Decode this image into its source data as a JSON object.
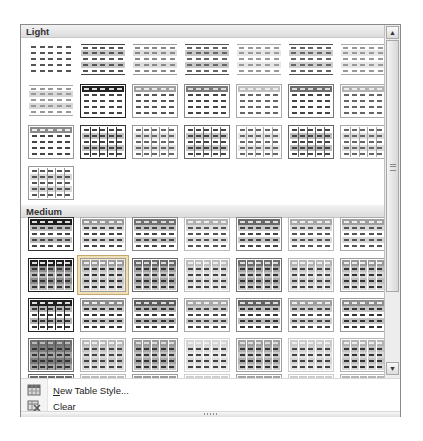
{
  "gallery": {
    "sections": [
      {
        "id": "light",
        "label": "Light",
        "top": 0
      },
      {
        "id": "medium",
        "label": "Medium",
        "top": 180
      }
    ],
    "columns_x": [
      7,
      59,
      111,
      163,
      215,
      267,
      319
    ],
    "light_rows_y": [
      18,
      59,
      100,
      141
    ],
    "medium_rows_y": [
      192,
      233,
      273,
      313,
      349
    ],
    "selected": {
      "section": "medium",
      "row": 1,
      "col": 1
    },
    "light_styles": [
      [
        {
          "header": "#ffffff",
          "band": "#ffffff",
          "lines": "none",
          "dash": "#555"
        },
        {
          "header": "#ffffff",
          "band": "#c8c8c8",
          "lines": "hrule",
          "rule": "#444",
          "dash": "#555"
        },
        {
          "header": "#ffffff",
          "band": "#dedede",
          "lines": "hrule",
          "rule": "#999",
          "dash": "#888"
        },
        {
          "header": "#ffffff",
          "band": "#c8c8c8",
          "lines": "hrule",
          "rule": "#555",
          "dash": "#666"
        },
        {
          "header": "#ffffff",
          "band": "#e6e6e6",
          "lines": "hrule",
          "rule": "#aaa",
          "dash": "#999"
        },
        {
          "header": "#ffffff",
          "band": "#cfcfcf",
          "lines": "hrule",
          "rule": "#555",
          "dash": "#666"
        },
        {
          "header": "#ffffff",
          "band": "#e6e6e6",
          "lines": "hrule",
          "rule": "#aaa",
          "dash": "#999"
        }
      ],
      [
        {
          "header": "#ffffff",
          "band": "#d8d8d8",
          "lines": "hrule",
          "rule": "#aaa",
          "dash": "#999"
        },
        {
          "header": "#222222",
          "band": "#ffffff",
          "lines": "rows",
          "rule": "#222",
          "dash": "#444",
          "hdash": "#ddd"
        },
        {
          "header": "#a0a0a0",
          "band": "#ffffff",
          "lines": "rows",
          "rule": "#999",
          "dash": "#555",
          "hdash": "#eee"
        },
        {
          "header": "#7a7a7a",
          "band": "#ffffff",
          "lines": "rows",
          "rule": "#888",
          "dash": "#444",
          "hdash": "#ddd"
        },
        {
          "header": "#c0c0c0",
          "band": "#ffffff",
          "lines": "rows",
          "rule": "#aaa",
          "dash": "#666",
          "hdash": "#eee"
        },
        {
          "header": "#6e6e6e",
          "band": "#ffffff",
          "lines": "rows",
          "rule": "#777",
          "dash": "#444",
          "hdash": "#ddd"
        },
        {
          "header": "#b4b4b4",
          "band": "#ffffff",
          "lines": "rows",
          "rule": "#aaa",
          "dash": "#666",
          "hdash": "#eee"
        }
      ],
      [
        {
          "header": "#8a8a8a",
          "band": "#ffffff",
          "lines": "rows",
          "rule": "#999",
          "dash": "#444",
          "hdash": "#eee"
        },
        {
          "header": "#ffffff",
          "band": "#c4c4c4",
          "lines": "grid",
          "rule": "#333",
          "dash": "#444"
        },
        {
          "header": "#ffffff",
          "band": "#e0e0e0",
          "lines": "grid",
          "rule": "#999",
          "dash": "#666"
        },
        {
          "header": "#ffffff",
          "band": "#c8c8c8",
          "lines": "grid",
          "rule": "#666",
          "dash": "#444"
        },
        {
          "header": "#ffffff",
          "band": "#e4e4e4",
          "lines": "grid",
          "rule": "#aaa",
          "dash": "#666"
        },
        {
          "header": "#ffffff",
          "band": "#bdbdbd",
          "lines": "grid",
          "rule": "#666",
          "dash": "#444"
        },
        {
          "header": "#ffffff",
          "band": "#dcdcdc",
          "lines": "grid",
          "rule": "#aaa",
          "dash": "#666"
        }
      ],
      [
        {
          "header": "#ffffff",
          "band": "#d8d8d8",
          "lines": "grid",
          "rule": "#999",
          "dash": "#555"
        }
      ]
    ],
    "medium_styles": [
      [
        {
          "header": "#1e1e1e",
          "band": "#bdbdbd",
          "lines": "rows",
          "rule": "#333",
          "dash": "#444",
          "hdash": "#ddd"
        },
        {
          "header": "#9a9a9a",
          "band": "#d6d6d6",
          "lines": "rows",
          "rule": "#aaa",
          "dash": "#444",
          "hdash": "#eee"
        },
        {
          "header": "#727272",
          "band": "#c4c4c4",
          "lines": "rows",
          "rule": "#888",
          "dash": "#444",
          "hdash": "#ddd"
        },
        {
          "header": "#b0b0b0",
          "band": "#dedede",
          "lines": "rows",
          "rule": "#bbb",
          "dash": "#555",
          "hdash": "#eee"
        },
        {
          "header": "#686868",
          "band": "#c8c8c8",
          "lines": "rows",
          "rule": "#888",
          "dash": "#444",
          "hdash": "#ddd"
        },
        {
          "header": "#a8a8a8",
          "band": "#dadada",
          "lines": "rows",
          "rule": "#bbb",
          "dash": "#555",
          "hdash": "#eee"
        },
        {
          "header": "#a0a0a0",
          "band": "#d8d8d8",
          "lines": "rows",
          "rule": "#aaa",
          "dash": "#555",
          "hdash": "#eee"
        }
      ],
      [
        {
          "header": "#1e1e1e",
          "band": "#8e8e8e",
          "alt": "#b8b8b8",
          "lines": "solidgrid",
          "rule": "#fff",
          "dash": "#333",
          "hdash": "#ddd"
        },
        {
          "header": "#9c9c9c",
          "band": "#c4c4c4",
          "alt": "#d8d8d8",
          "lines": "solidgrid",
          "rule": "#fff",
          "dash": "#333",
          "hdash": "#eee"
        },
        {
          "header": "#6a6a6a",
          "band": "#a4a4a4",
          "alt": "#c4c4c4",
          "lines": "solidgrid",
          "rule": "#fff",
          "dash": "#333",
          "hdash": "#ddd"
        },
        {
          "header": "#bdbdbd",
          "band": "#d4d4d4",
          "alt": "#e4e4e4",
          "lines": "solidgrid",
          "rule": "#fff",
          "dash": "#444",
          "hdash": "#eee"
        },
        {
          "header": "#6e6e6e",
          "band": "#a8a8a8",
          "alt": "#c8c8c8",
          "lines": "solidgrid",
          "rule": "#fff",
          "dash": "#333",
          "hdash": "#ddd"
        },
        {
          "header": "#b4b4b4",
          "band": "#cccccc",
          "alt": "#e0e0e0",
          "lines": "solidgrid",
          "rule": "#fff",
          "dash": "#444",
          "hdash": "#eee"
        },
        {
          "header": "#9a9a9a",
          "band": "#c0c0c0",
          "alt": "#d8d8d8",
          "lines": "solidgrid",
          "rule": "#fff",
          "dash": "#333",
          "hdash": "#eee"
        }
      ],
      [
        {
          "header": "#1e1e1e",
          "band": "#b4b4b4",
          "alt": "#ffffff",
          "lines": "boxgrid",
          "rule": "#222",
          "dash": "#333",
          "hdash": "#ddd"
        },
        {
          "header": "#8c8c8c",
          "band": "#c8c8c8",
          "alt": "#ffffff",
          "lines": "rows",
          "rule": "#999",
          "dash": "#333",
          "hdash": "#eee"
        },
        {
          "header": "#5e5e5e",
          "band": "#b4b4b4",
          "alt": "#ffffff",
          "lines": "rows",
          "rule": "#888",
          "dash": "#333",
          "hdash": "#ddd"
        },
        {
          "header": "#a8a8a8",
          "band": "#cccccc",
          "alt": "#ffffff",
          "lines": "rows",
          "rule": "#aaa",
          "dash": "#444",
          "hdash": "#eee"
        },
        {
          "header": "#626262",
          "band": "#bcbcbc",
          "alt": "#ffffff",
          "lines": "rows",
          "rule": "#888",
          "dash": "#333",
          "hdash": "#ddd"
        },
        {
          "header": "#a0a0a0",
          "band": "#cccccc",
          "alt": "#ffffff",
          "lines": "rows",
          "rule": "#aaa",
          "dash": "#444",
          "hdash": "#eee"
        },
        {
          "header": "#8e8e8e",
          "band": "#c4c4c4",
          "alt": "#ffffff",
          "lines": "rows",
          "rule": "#999",
          "dash": "#333",
          "hdash": "#eee"
        }
      ],
      [
        {
          "header": "#6e6e6e",
          "band": "#7c7c7c",
          "alt": "#a4a4a4",
          "lines": "solidgrid",
          "rule": "#555",
          "dash": "#333",
          "hdash": "#bbb"
        },
        {
          "header": "#b8b8b8",
          "band": "#c8c8c8",
          "alt": "#dadada",
          "lines": "solidgrid",
          "rule": "#fff",
          "dash": "#444",
          "hdash": "#eee"
        },
        {
          "header": "#9a9a9a",
          "band": "#a8a8a8",
          "alt": "#c4c4c4",
          "lines": "solidgrid",
          "rule": "#fff",
          "dash": "#333",
          "hdash": "#ddd"
        },
        {
          "header": "#d4d4d4",
          "band": "#dcdcdc",
          "alt": "#eaeaea",
          "lines": "solidgrid",
          "rule": "#fff",
          "dash": "#444",
          "hdash": "#eee"
        },
        {
          "header": "#a0a0a0",
          "band": "#b0b0b0",
          "alt": "#cccccc",
          "lines": "solidgrid",
          "rule": "#fff",
          "dash": "#333",
          "hdash": "#ddd"
        },
        {
          "header": "#cacaca",
          "band": "#d4d4d4",
          "alt": "#e4e4e4",
          "lines": "solidgrid",
          "rule": "#fff",
          "dash": "#444",
          "hdash": "#eee"
        },
        {
          "header": "#b4b4b4",
          "band": "#c4c4c4",
          "alt": "#d8d8d8",
          "lines": "solidgrid",
          "rule": "#fff",
          "dash": "#333",
          "hdash": "#eee"
        }
      ],
      [
        {
          "header": "#6a6a6a",
          "band": "#8a8a8a",
          "lines": "solidgrid",
          "rule": "#fff",
          "dash": "#333",
          "hdash": "#ccc"
        },
        {
          "header": "#bcbcbc",
          "band": "#cccccc",
          "lines": "solidgrid",
          "rule": "#fff",
          "dash": "#444",
          "hdash": "#eee"
        },
        {
          "header": "#9c9c9c",
          "band": "#aaaaaa",
          "lines": "solidgrid",
          "rule": "#fff",
          "dash": "#333",
          "hdash": "#ddd"
        },
        {
          "header": "#d0d0d0",
          "band": "#dadada",
          "lines": "solidgrid",
          "rule": "#fff",
          "dash": "#444",
          "hdash": "#eee"
        },
        {
          "header": "#a4a4a4",
          "band": "#b4b4b4",
          "lines": "solidgrid",
          "rule": "#fff",
          "dash": "#333",
          "hdash": "#ddd"
        },
        {
          "header": "#cccccc",
          "band": "#d6d6d6",
          "lines": "solidgrid",
          "rule": "#fff",
          "dash": "#444",
          "hdash": "#eee"
        },
        {
          "header": "#b6b6b6",
          "band": "#c6c6c6",
          "lines": "solidgrid",
          "rule": "#fff",
          "dash": "#333",
          "hdash": "#eee"
        }
      ]
    ]
  },
  "scrollbar": {
    "up_arrow": "▲",
    "down_arrow": "▼",
    "thumb_top": 15,
    "thumb_height": 252
  },
  "menu": {
    "items": [
      {
        "id": "new-table-style",
        "icon": "new-table-style-icon",
        "accel": "N",
        "rest": "ew Table Style..."
      },
      {
        "id": "clear",
        "icon": "clear-icon",
        "accel": "C",
        "rest": "lear"
      }
    ]
  }
}
